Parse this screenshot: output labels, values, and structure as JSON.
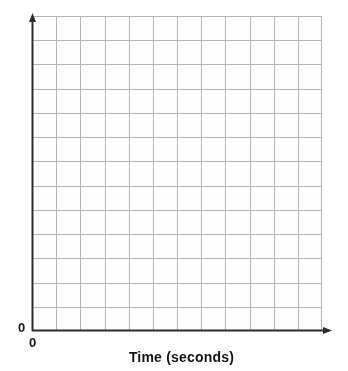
{
  "chart_data": {
    "type": "line",
    "title": "",
    "subtitle": "",
    "xlabel": "Time (seconds)",
    "ylabel": "",
    "x_origin_label": "0",
    "y_origin_label": "0",
    "xlim": [
      0,
      12
    ],
    "ylim": [
      0,
      13
    ],
    "x_tick_labels": [],
    "y_tick_labels": [],
    "grid": true,
    "grid_columns": 12,
    "grid_rows": 13,
    "legend": null,
    "legend_position": "none",
    "annotations": [],
    "series": [],
    "categories": [],
    "values": [],
    "note": "Empty blank grid for plotting; no data plotted"
  },
  "axes": {
    "x_axis_name": "x-axis",
    "y_axis_name": "y-axis",
    "x_arrow": "arrow-right",
    "y_arrow": "arrow-up",
    "axis_color": "#2b2b2b",
    "grid_color": "#b4b4b4",
    "grid_minor_color": "#d9d9d9",
    "plot_background": "#fdfdfd"
  },
  "labels": {
    "x_axis_title": "Time (seconds)",
    "origin_y": "0",
    "origin_x": "0"
  }
}
